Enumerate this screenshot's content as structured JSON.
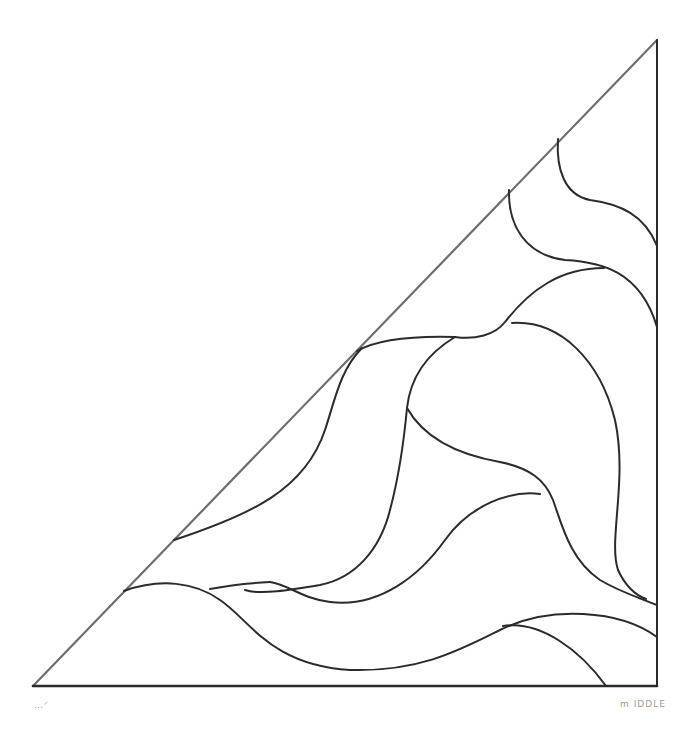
{
  "drawing": {
    "title": "",
    "description": "Hand-drawn quilting pattern: right triangle filled with flowing curved lines",
    "colors": {
      "background": "#ffffff",
      "stroke": "#2b2b2b",
      "hypotenuse": "#6e6e6e",
      "label": "#9a9a9a"
    },
    "labels": {
      "bottom_left": "…ᐟ",
      "bottom_right": "m IDDLE"
    }
  }
}
